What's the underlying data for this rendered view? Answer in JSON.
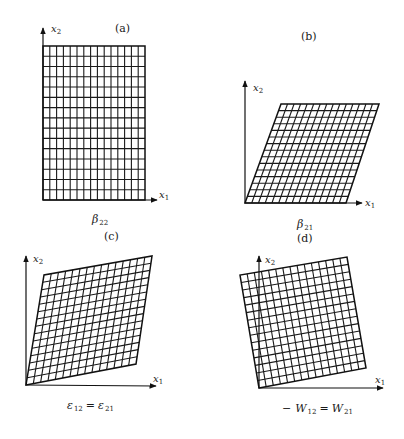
{
  "figure": {
    "panels": [
      {
        "id": "a",
        "label": "(a)",
        "caption_main": "β",
        "caption_sub": "22",
        "x_axis": {
          "name": "x",
          "sub": "1"
        },
        "y_axis": {
          "name": "x",
          "sub": "2"
        },
        "grid": {
          "cols": 15,
          "rows": 15,
          "corners": {
            "bl": [
              43,
              200
            ],
            "br": [
              145,
              200
            ],
            "tr": [
              145,
              46
            ],
            "tl": [
              43,
              46
            ]
          }
        },
        "axes": {
          "origin": [
            43,
            200
          ],
          "x_end": [
            157,
            200
          ],
          "y_end": [
            43,
            28
          ]
        },
        "label_pos": [
          115,
          32
        ],
        "caption_pos": [
          92,
          223
        ],
        "x_label_pos": [
          159,
          198
        ],
        "y_label_pos": [
          51,
          32
        ]
      },
      {
        "id": "b",
        "label": "(b)",
        "caption_main": "β",
        "caption_sub": "21",
        "x_axis": {
          "name": "x",
          "sub": "1"
        },
        "y_axis": {
          "name": "x",
          "sub": "2"
        },
        "grid": {
          "cols": 15,
          "rows": 15,
          "corners": {
            "bl": [
              245,
              203
            ],
            "br": [
              346,
              203
            ],
            "tr": [
              379,
              104
            ],
            "tl": [
              281,
              104
            ]
          }
        },
        "axes": {
          "origin": [
            245,
            203
          ],
          "x_end": [
            362,
            203
          ],
          "y_end": [
            245,
            81
          ]
        },
        "label_pos": [
          301,
          40
        ],
        "caption_pos": [
          297,
          228
        ],
        "x_label_pos": [
          365,
          206
        ],
        "y_label_pos": [
          253,
          91
        ]
      },
      {
        "id": "c",
        "label": "(c)",
        "caption_main": "ε",
        "caption_sub": "12",
        "caption_eq": "=",
        "caption_main2": "ε",
        "caption_sub2": "21",
        "x_axis": {
          "name": "x",
          "sub": "1"
        },
        "y_axis": {
          "name": "x",
          "sub": "2"
        },
        "grid": {
          "cols": 15,
          "rows": 15,
          "corners": {
            "bl": [
              26,
              385
            ],
            "br": [
              136,
              364
            ],
            "tr": [
              152,
              256
            ],
            "tl": [
              44,
              275
            ]
          }
        },
        "axes": {
          "origin": [
            26,
            385
          ],
          "x_end": [
            156,
            386
          ],
          "y_end": [
            26,
            256
          ]
        },
        "label_pos": [
          104,
          240
        ],
        "caption_pos": [
          67,
          409
        ],
        "x_label_pos": [
          153,
          382
        ],
        "y_label_pos": [
          33,
          262
        ]
      },
      {
        "id": "d",
        "label": "(d)",
        "caption_prefix": "−",
        "caption_main": "W",
        "caption_sub": "12",
        "caption_eq": "=",
        "caption_main2": "W",
        "caption_sub2": "21",
        "x_axis": {
          "name": "x",
          "sub": "1"
        },
        "y_axis": {
          "name": "x",
          "sub": "2"
        },
        "grid": {
          "cols": 15,
          "rows": 15,
          "corners": {
            "bl": [
              259,
              388
            ],
            "br": [
              366,
              368
            ],
            "tr": [
              347,
              257
            ],
            "tl": [
              240,
              275
            ]
          }
        },
        "axes": {
          "origin": [
            259,
            388
          ],
          "x_end": [
            383,
            388
          ],
          "y_end": [
            259,
            256
          ]
        },
        "label_pos": [
          297,
          242
        ],
        "caption_pos": [
          282,
          412
        ],
        "x_label_pos": [
          375,
          383
        ],
        "y_label_pos": [
          265,
          263
        ]
      }
    ]
  }
}
